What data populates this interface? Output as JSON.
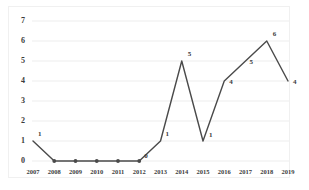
{
  "chart_data": {
    "type": "line",
    "title": "",
    "subtitle": "",
    "xlabel": "",
    "ylabel": "",
    "categories": [
      "2007",
      "2008",
      "2009",
      "2010",
      "2011",
      "2012",
      "2013",
      "2014",
      "2015",
      "2016",
      "2017",
      "2018",
      "2019"
    ],
    "values": [
      1,
      0,
      0,
      0,
      0,
      0,
      1,
      5,
      1,
      4,
      5,
      6,
      4
    ],
    "data_labels": [
      "1",
      "0",
      "0",
      "0",
      "0",
      "0",
      "1",
      "5",
      "1",
      "4",
      "5",
      "6",
      "4"
    ],
    "data_labels_shown": [
      "1",
      "",
      "",
      "",
      "",
      "0",
      "1",
      "5",
      "1",
      "4",
      "5",
      "6",
      "4"
    ],
    "ylim": [
      0,
      7
    ],
    "ytick_labels": [
      "0",
      "1",
      "2",
      "3",
      "4",
      "5",
      "6",
      "7"
    ],
    "ytick_values": [
      0,
      1,
      2,
      3,
      4,
      5,
      6,
      7
    ],
    "grid": true,
    "grid_axis": "y",
    "legend": false,
    "legend_position": "none",
    "markers": true,
    "series_color": "#4a4a4a",
    "grid_color": "#ededed",
    "text_color": "#3b3b3b",
    "background_color": "#ffffff",
    "border_color": "#f0f0f0"
  }
}
